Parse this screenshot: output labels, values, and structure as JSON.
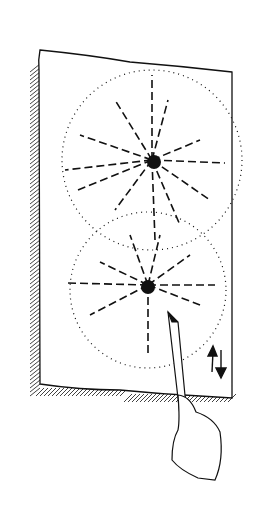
{
  "figure": {
    "background": "#ffffff",
    "ink": "#111111",
    "elements": {
      "paper": "sheet of paper pinned against a hatched wall shadow",
      "upper_burst": "radial spray burst with dotted circular outline",
      "lower_burst": "radial spray burst with dotted circular outline",
      "arrows": "up and down arrows indicating vertical motion",
      "hand": "hand holding a brush / pen touching the lower burst"
    }
  }
}
